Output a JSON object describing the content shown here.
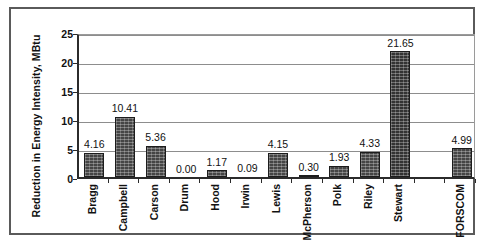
{
  "chart_data": {
    "type": "bar",
    "title": "",
    "xlabel": "",
    "ylabel": "Reduction in Energy Intensity, MBtu",
    "categories": [
      "Bragg",
      "Campbell",
      "Carson",
      "Drum",
      "Hood",
      "Irwin",
      "Lewis",
      "McPherson",
      "Polk",
      "Riley",
      "Stewart",
      "",
      "FORSCOM"
    ],
    "values": [
      4.16,
      10.41,
      5.36,
      0.0,
      1.17,
      0.09,
      4.15,
      0.3,
      1.93,
      4.33,
      21.65,
      null,
      4.99
    ],
    "value_labels": [
      "4.16",
      "10.41",
      "5.36",
      "0.00",
      "1.17",
      "0.09",
      "4.15",
      "0.30",
      "1.93",
      "4.33",
      "21.65",
      "",
      "4.99"
    ],
    "ylim": [
      0,
      25
    ],
    "ytick_labels": [
      "0",
      "5",
      "10",
      "15",
      "20",
      "25"
    ],
    "ytick_values": [
      0,
      5,
      10,
      15,
      20,
      25
    ],
    "grid": true,
    "legend": "none",
    "colors": {
      "bar_fill": "#454545",
      "bar_edge": "#1c1c1c",
      "gridline": "#8d8d8d",
      "axis": "#2b2b2b",
      "frame": "#5a5a5a",
      "text": "#111111",
      "background": "#ffffff"
    }
  }
}
